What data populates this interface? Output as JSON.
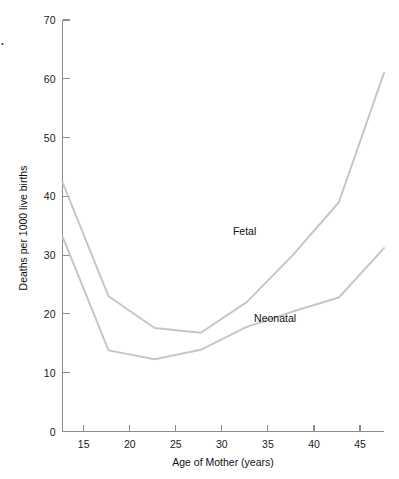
{
  "chart_data": {
    "type": "line",
    "title": "",
    "xlabel": "Age of Mother (years)",
    "ylabel": "Deaths per 1000 live births",
    "xlim": [
      12.7,
      47.6
    ],
    "ylim": [
      0,
      70
    ],
    "xticks": [
      15,
      20,
      25,
      30,
      35,
      40,
      45
    ],
    "xtick_labels": [
      "15",
      "20",
      "25",
      "30",
      "35",
      "40",
      "45"
    ],
    "yticks": [
      0,
      10,
      20,
      30,
      40,
      50,
      60,
      70
    ],
    "ytick_labels": [
      "0",
      "10",
      "20",
      "30",
      "40",
      "50",
      "60",
      "70"
    ],
    "grid": false,
    "legend_position": "inline-annotations",
    "series": [
      {
        "name": "Fetal",
        "color": "#c6c6c6",
        "x": [
          12.7,
          17.7,
          22.7,
          27.7,
          32.7,
          37.7,
          42.7,
          47.6
        ],
        "values": [
          42.4,
          23.0,
          17.6,
          16.8,
          22.0,
          30.0,
          39.0,
          61.0
        ],
        "label_text": "Fetal",
        "label_x": 31.2,
        "label_y": 33.5
      },
      {
        "name": "Neonatal",
        "color": "#c6c6c6",
        "x": [
          12.7,
          17.7,
          22.7,
          27.7,
          32.7,
          37.7,
          42.7,
          47.6
        ],
        "values": [
          33.2,
          13.8,
          12.3,
          13.9,
          17.8,
          20.4,
          22.8,
          31.2
        ],
        "label_text": "Neonatal",
        "label_x": 33.5,
        "label_y": 18.6
      }
    ]
  },
  "axes": {
    "y_title": "Deaths per 1000 live births",
    "x_title": "Age of Mother (years)"
  },
  "annotations": {
    "fetal_label": "Fetal",
    "neonatal_label": "Neonatal"
  },
  "colors": {
    "line": "#c6c6c6",
    "axis": "#8c8c8c",
    "text": "#111111",
    "background": "#ffffff"
  }
}
